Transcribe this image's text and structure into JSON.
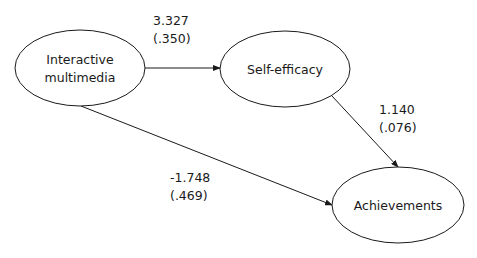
{
  "diagram": {
    "type": "path-model",
    "nodes": [
      {
        "id": "interactive_multimedia",
        "label_line1": "Interactive",
        "label_line2": "multimedia",
        "cx": 80,
        "cy": 68,
        "rx": 65,
        "ry": 38
      },
      {
        "id": "self_efficacy",
        "label": "Self-efficacy",
        "cx": 285,
        "cy": 69,
        "rx": 65,
        "ry": 38
      },
      {
        "id": "achievements",
        "label": "Achievements",
        "cx": 398,
        "cy": 205,
        "rx": 66,
        "ry": 38
      }
    ],
    "edges": [
      {
        "from": "interactive_multimedia",
        "to": "self_efficacy",
        "coefficient": "3.327",
        "std_error": "(.350)"
      },
      {
        "from": "self_efficacy",
        "to": "achievements",
        "coefficient": "1.140",
        "std_error": "(.076)"
      },
      {
        "from": "interactive_multimedia",
        "to": "achievements",
        "coefficient": "-1.748",
        "std_error": "(.469)"
      }
    ],
    "colors": {
      "stroke": "#1a1a1a",
      "background": "#ffffff",
      "text": "#1a1a1a"
    }
  }
}
